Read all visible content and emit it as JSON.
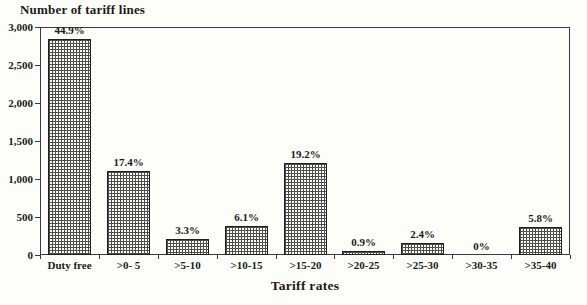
{
  "chart_data": {
    "type": "bar",
    "title": "",
    "ylabel": "Number of tariff lines",
    "xlabel": "Tariff rates",
    "categories": [
      "Duty free",
      ">0- 5",
      ">5-10",
      ">10-15",
      ">15-20",
      ">20-25",
      ">25-30",
      ">30-35",
      ">35-40"
    ],
    "values": [
      2840,
      1100,
      210,
      385,
      1215,
      57,
      152,
      0,
      366
    ],
    "bar_labels": [
      "44.9%",
      "17.4%",
      "3.3%",
      "6.1%",
      "19.2%",
      "0.9%",
      "2.4%",
      "0%",
      "5.8%"
    ],
    "y_ticks": [
      "0",
      "500",
      "1,000",
      "1,500",
      "2,000",
      "2,500",
      "3,000"
    ],
    "y_tick_values": [
      0,
      500,
      1000,
      1500,
      2000,
      2500,
      3000
    ],
    "ylim": [
      0,
      3000
    ],
    "grid": false,
    "legend_position": "none",
    "bar_fill": "crosshatch-grid-pattern",
    "colors": {
      "text": "#1a1a1a",
      "frame_line": "#3b3b3b",
      "bar_border": "#1f1f1f",
      "bar_pattern": "#4e4e4e",
      "background": "#fdfdfa"
    }
  }
}
